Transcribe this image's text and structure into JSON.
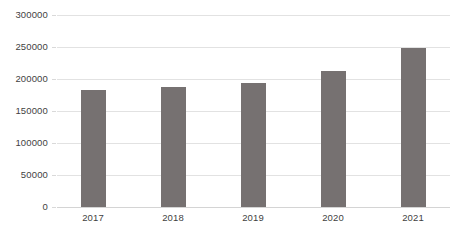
{
  "chart_data": {
    "type": "bar",
    "title": "",
    "subtitle": "",
    "xlabel": "",
    "ylabel": "",
    "categories": [
      "2017",
      "2018",
      "2019",
      "2020",
      "2021"
    ],
    "values": [
      183000,
      187500,
      194000,
      212500,
      248000
    ],
    "series": [
      {
        "name": "",
        "values": [
          183000,
          187500,
          194000,
          212500,
          248000
        ]
      }
    ],
    "ylim": [
      0,
      300000
    ],
    "y_ticks": [
      0,
      50000,
      100000,
      150000,
      200000,
      250000,
      300000
    ],
    "y_tick_labels": [
      "0",
      "50000",
      "100000",
      "150000",
      "200000",
      "250000",
      "300000"
    ],
    "grid": true,
    "grid_axis": "y",
    "legend": false,
    "legend_position": "none",
    "bar_color": "#767171",
    "gridline_color": "#e2e2e2",
    "axis_text_color": "#3f3f3f",
    "background_color": "#ffffff"
  }
}
